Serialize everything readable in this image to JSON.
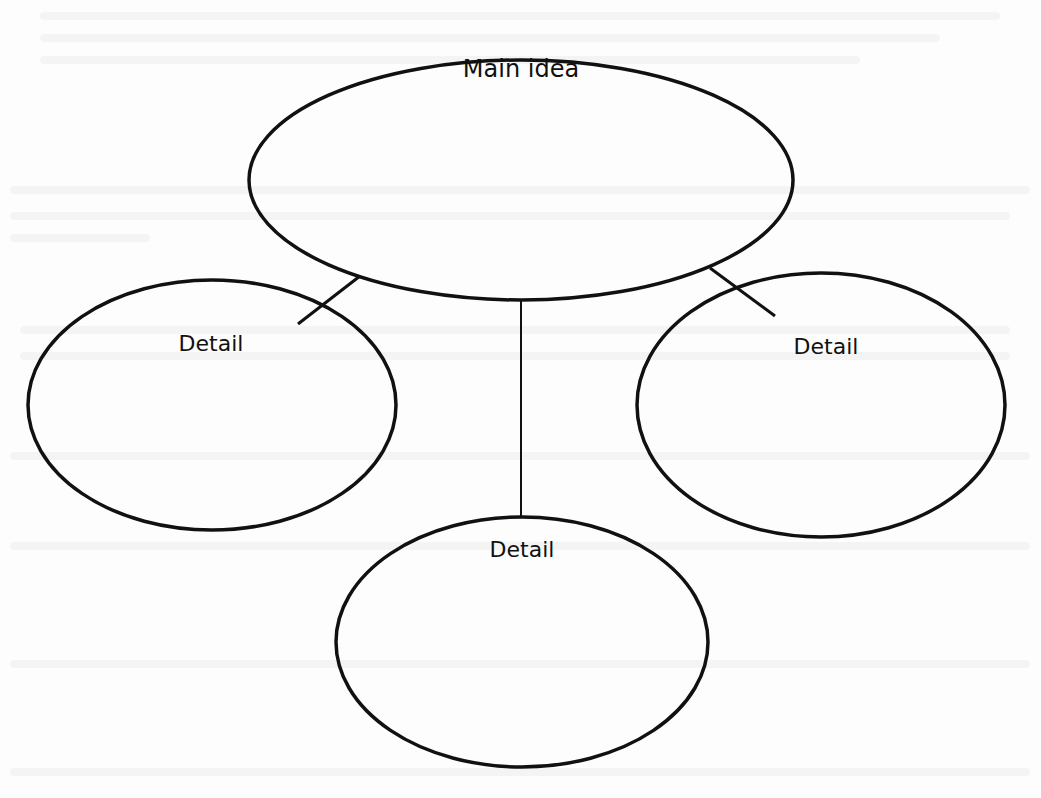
{
  "diagram": {
    "type": "main-idea-and-details organizer",
    "main_idea": {
      "label": "Main idea"
    },
    "details": [
      {
        "label": "Detail",
        "position": "left"
      },
      {
        "label": "Detail",
        "position": "right"
      },
      {
        "label": "Detail",
        "position": "bottom-center"
      }
    ],
    "stroke_color": "#111111",
    "background_color": "#ffffff"
  }
}
